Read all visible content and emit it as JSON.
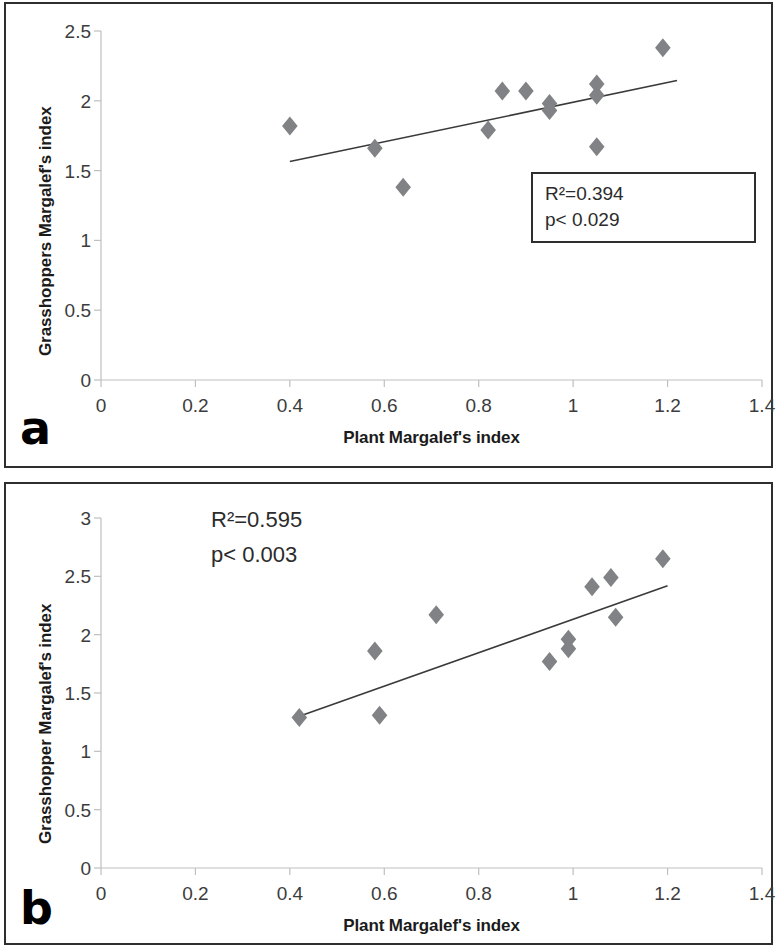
{
  "figure": {
    "background": "#ffffff",
    "marker_color": "#808285",
    "trendline_color": "#3a3a3a",
    "axis_color": "#bfbfbf",
    "frame_color": "#2e2e2e"
  },
  "panels": [
    {
      "letter": "a",
      "stats": {
        "r2": "R²=0.394",
        "p": "p< 0.029",
        "boxed": true
      }
    },
    {
      "letter": "b",
      "stats": {
        "r2": "R²=0.595",
        "p": "p< 0.003",
        "boxed": false
      }
    }
  ],
  "chart_data": [
    {
      "type": "scatter",
      "panel": "a",
      "title": "",
      "xlabel": "Plant Margalef's index",
      "ylabel": "Grasshoppers Margalef's index",
      "xlim": [
        0,
        1.4
      ],
      "ylim": [
        0,
        2.5
      ],
      "xticks": [
        0,
        0.2,
        0.4,
        0.6,
        0.8,
        1,
        1.2,
        1.4
      ],
      "xticklabels": [
        "0",
        "0.2",
        "0.4",
        "0.6",
        "0.8",
        "1",
        "1.2",
        "1.4"
      ],
      "yticks": [
        0,
        0.5,
        1,
        1.5,
        2,
        2.5
      ],
      "yticklabels": [
        "0",
        "0.5",
        "1",
        "1.5",
        "2",
        "2.5"
      ],
      "grid": false,
      "legend": "none",
      "marker": "diamond",
      "points": [
        {
          "x": 0.4,
          "y": 1.82
        },
        {
          "x": 0.58,
          "y": 1.66
        },
        {
          "x": 0.64,
          "y": 1.38
        },
        {
          "x": 0.82,
          "y": 1.79
        },
        {
          "x": 0.85,
          "y": 2.07
        },
        {
          "x": 0.9,
          "y": 2.07
        },
        {
          "x": 0.95,
          "y": 1.98
        },
        {
          "x": 0.95,
          "y": 1.93
        },
        {
          "x": 1.05,
          "y": 2.12
        },
        {
          "x": 1.05,
          "y": 2.04
        },
        {
          "x": 1.05,
          "y": 1.67
        },
        {
          "x": 1.19,
          "y": 2.38
        }
      ],
      "trendline": {
        "x0": 0.4,
        "y0": 1.565,
        "x1": 1.22,
        "y1": 2.145
      },
      "annotations": [
        "R²=0.394",
        "p< 0.029"
      ]
    },
    {
      "type": "scatter",
      "panel": "b",
      "title": "",
      "xlabel": "Plant Margalef's index",
      "ylabel": "Grasshopper Margalef's index",
      "xlim": [
        0,
        1.4
      ],
      "ylim": [
        0,
        3
      ],
      "xticks": [
        0,
        0.2,
        0.4,
        0.6,
        0.8,
        1,
        1.2,
        1.4
      ],
      "xticklabels": [
        "0",
        "0.2",
        "0.4",
        "0.6",
        "0.8",
        "1",
        "1.2",
        "1.4"
      ],
      "yticks": [
        0,
        0.5,
        1,
        1.5,
        2,
        2.5,
        3
      ],
      "yticklabels": [
        "0",
        "0.5",
        "1",
        "1.5",
        "2",
        "2.5",
        "3"
      ],
      "grid": false,
      "legend": "none",
      "marker": "diamond",
      "points": [
        {
          "x": 0.42,
          "y": 1.29
        },
        {
          "x": 0.58,
          "y": 1.86
        },
        {
          "x": 0.59,
          "y": 1.31
        },
        {
          "x": 0.71,
          "y": 2.17
        },
        {
          "x": 0.95,
          "y": 1.77
        },
        {
          "x": 0.99,
          "y": 1.96
        },
        {
          "x": 0.99,
          "y": 1.88
        },
        {
          "x": 1.04,
          "y": 2.41
        },
        {
          "x": 1.08,
          "y": 2.49
        },
        {
          "x": 1.09,
          "y": 2.15
        },
        {
          "x": 1.19,
          "y": 2.65
        }
      ],
      "trendline": {
        "x0": 0.42,
        "y0": 1.3,
        "x1": 1.2,
        "y1": 2.42
      },
      "annotations": [
        "R²=0.595",
        "p< 0.003"
      ]
    }
  ]
}
